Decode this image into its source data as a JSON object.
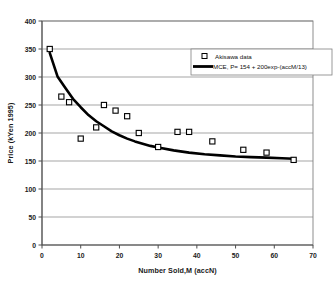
{
  "chart_data": {
    "type": "scatter",
    "title": "",
    "xlabel": "Number Sold,M (accN)",
    "ylabel": "Price (kYen 1995)",
    "xlim": [
      0,
      70
    ],
    "ylim": [
      0,
      400
    ],
    "xticks": [
      0,
      10,
      20,
      30,
      40,
      50,
      60,
      70
    ],
    "yticks": [
      0,
      50,
      100,
      150,
      200,
      250,
      300,
      350,
      400
    ],
    "xtick_labels": [
      "0",
      "10",
      "20",
      "30",
      "40",
      "50",
      "60",
      "70"
    ],
    "ytick_labels": [
      "0",
      "50",
      "100",
      "150",
      "200",
      "250",
      "300",
      "350",
      "400"
    ],
    "grid": "horizontal",
    "legend_position": "top-right",
    "series": [
      {
        "name": "Akisawa data",
        "type": "scatter",
        "marker": "open-square",
        "color": "#000000",
        "points": [
          {
            "x": 2,
            "y": 350
          },
          {
            "x": 5,
            "y": 265
          },
          {
            "x": 7,
            "y": 255
          },
          {
            "x": 10,
            "y": 190
          },
          {
            "x": 14,
            "y": 210
          },
          {
            "x": 16,
            "y": 250
          },
          {
            "x": 19,
            "y": 240
          },
          {
            "x": 22,
            "y": 230
          },
          {
            "x": 25,
            "y": 200
          },
          {
            "x": 30,
            "y": 175
          },
          {
            "x": 35,
            "y": 202
          },
          {
            "x": 38,
            "y": 202
          },
          {
            "x": 44,
            "y": 185
          },
          {
            "x": 52,
            "y": 170
          },
          {
            "x": 58,
            "y": 165
          },
          {
            "x": 65,
            "y": 152
          }
        ]
      },
      {
        "name": "MCE, P= 154 + 200exp-(accM/13)",
        "type": "line",
        "color": "#000000",
        "formula": {
          "intercept": 154,
          "amplitude": 200,
          "decay": 13
        },
        "points": [
          {
            "x": 2,
            "y": 343
          },
          {
            "x": 4,
            "y": 301
          },
          {
            "x": 6,
            "y": 281
          },
          {
            "x": 8,
            "y": 261
          },
          {
            "x": 10,
            "y": 246
          },
          {
            "x": 12,
            "y": 232
          },
          {
            "x": 14,
            "y": 221
          },
          {
            "x": 16,
            "y": 212
          },
          {
            "x": 18,
            "y": 203
          },
          {
            "x": 20,
            "y": 196
          },
          {
            "x": 22,
            "y": 190
          },
          {
            "x": 24,
            "y": 185
          },
          {
            "x": 26,
            "y": 181
          },
          {
            "x": 28,
            "y": 177
          },
          {
            "x": 30,
            "y": 174
          },
          {
            "x": 34,
            "y": 169
          },
          {
            "x": 38,
            "y": 165
          },
          {
            "x": 42,
            "y": 162
          },
          {
            "x": 46,
            "y": 160
          },
          {
            "x": 50,
            "y": 158
          },
          {
            "x": 54,
            "y": 157
          },
          {
            "x": 58,
            "y": 156
          },
          {
            "x": 62,
            "y": 155
          },
          {
            "x": 65,
            "y": 154
          }
        ]
      }
    ]
  },
  "legend": {
    "items": [
      {
        "label": "Akisawa data",
        "marker": "open-square"
      },
      {
        "label": "MCE, P= 154 + 200exp-(accM/13)",
        "marker": "line"
      }
    ]
  }
}
